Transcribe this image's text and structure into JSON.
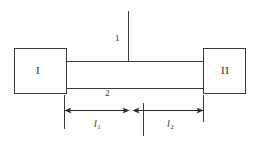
{
  "diagram": {
    "type": "mechanical-schematic",
    "width": 258,
    "height": 141,
    "background_color": "#ffffff",
    "line_color": "#3a3a3a",
    "text_color": "#2b2b2b",
    "blocks": [
      {
        "id": "left",
        "label": "I"
      },
      {
        "id": "right",
        "label": "II"
      }
    ],
    "callouts": [
      {
        "id": "callout-1",
        "label": "1"
      },
      {
        "id": "callout-2",
        "label": "2"
      }
    ],
    "dimensions": [
      {
        "id": "dim-l1",
        "symbol": "l",
        "subscript": "1"
      },
      {
        "id": "dim-l2",
        "symbol": "l",
        "subscript": "2"
      }
    ]
  }
}
